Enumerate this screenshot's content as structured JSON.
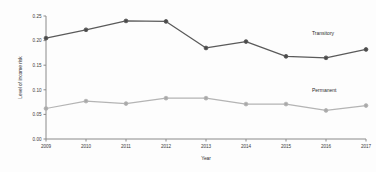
{
  "chart_data": {
    "type": "line",
    "title": "",
    "xlabel": "Year",
    "ylabel": "Level of income risk",
    "categories": [
      "2009",
      "2010",
      "2011",
      "2012",
      "2013",
      "2014",
      "2015",
      "2016",
      "2017"
    ],
    "x": [
      2009,
      2010,
      2011,
      2012,
      2013,
      2014,
      2015,
      2016,
      2017
    ],
    "series": [
      {
        "name": "Transitory",
        "color": "#5a5a5a",
        "marker_color": "#4a4a4a",
        "values": [
          0.205,
          0.222,
          0.24,
          0.239,
          0.185,
          0.198,
          0.168,
          0.165,
          0.182
        ]
      },
      {
        "name": "Permanent",
        "color": "#b4b4b4",
        "marker_color": "#a8a8a8",
        "values": [
          0.062,
          0.077,
          0.072,
          0.083,
          0.083,
          0.071,
          0.071,
          0.058,
          0.068
        ]
      }
    ],
    "ylim": [
      0.0,
      0.25
    ],
    "yticks": [
      "0.00",
      "0.05",
      "0.10",
      "0.15",
      "0.20",
      "0.25"
    ],
    "ytick_values": [
      0.0,
      0.05,
      0.1,
      0.15,
      0.2,
      0.25
    ],
    "grid": false,
    "legend_position": "inline-right",
    "annotations": [
      {
        "text": "Transitory",
        "series": "Transitory"
      },
      {
        "text": "Permanent",
        "series": "Permanent"
      }
    ]
  }
}
